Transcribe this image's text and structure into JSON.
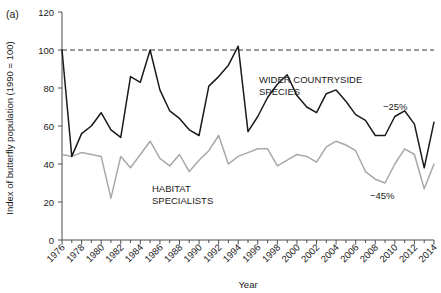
{
  "figure": {
    "panel_label": "(a)"
  },
  "chart_data": {
    "type": "line",
    "title": "",
    "xlabel": "Year",
    "ylabel": "Index of butterfly population (1990 = 100)",
    "xlim": [
      1976,
      2014
    ],
    "ylim": [
      0,
      120
    ],
    "yticks": [
      0,
      20,
      40,
      60,
      80,
      100,
      120
    ],
    "xticks": [
      1976,
      1978,
      1980,
      1982,
      1984,
      1986,
      1988,
      1990,
      1992,
      1994,
      1996,
      1998,
      2000,
      2002,
      2004,
      2006,
      2008,
      2010,
      2012,
      2014
    ],
    "xtick_minor_step": 1,
    "grid": false,
    "legend_position": "inline-annotation",
    "reference_line": {
      "y": 100,
      "style": "dashed",
      "color": "#333333"
    },
    "x": [
      1976,
      1977,
      1978,
      1979,
      1980,
      1981,
      1982,
      1983,
      1984,
      1985,
      1986,
      1987,
      1988,
      1989,
      1990,
      1991,
      1992,
      1993,
      1994,
      1995,
      1996,
      1997,
      1998,
      1999,
      2000,
      2001,
      2002,
      2003,
      2004,
      2005,
      2006,
      2007,
      2008,
      2009,
      2010,
      2011,
      2012,
      2013,
      2014
    ],
    "series": [
      {
        "name": "WIDER COUNTRYSIDE SPECIES",
        "color": "#1a1a1a",
        "values": [
          100,
          44,
          56,
          60,
          67,
          58,
          54,
          86,
          83,
          100,
          79,
          68,
          64,
          58,
          55,
          81,
          86,
          92,
          102,
          57,
          65,
          75,
          82,
          87,
          76,
          70,
          67,
          77,
          79,
          73,
          66,
          63,
          55,
          55,
          65,
          68,
          61,
          38,
          62
        ]
      },
      {
        "name": "HABITAT SPECIALISTS",
        "color": "#a8a8a8",
        "values": [
          45,
          44,
          46,
          45,
          44,
          22,
          44,
          38,
          45,
          52,
          43,
          39,
          45,
          36,
          42,
          47,
          55,
          40,
          44,
          46,
          48,
          48,
          39,
          42,
          45,
          44,
          41,
          49,
          52,
          50,
          47,
          36,
          32,
          30,
          40,
          48,
          45,
          27,
          40
        ]
      }
    ],
    "annotations": [
      {
        "text": "WIDER COUNTRYSIDE",
        "x_px": 259,
        "y_px": 83
      },
      {
        "text": "SPECIES",
        "x_px": 259,
        "y_px": 95
      },
      {
        "text": "HABITAT",
        "x_px": 152,
        "y_px": 192
      },
      {
        "text": "SPECIALISTS",
        "x_px": 152,
        "y_px": 204
      },
      {
        "text": "−25%",
        "x_px": 383,
        "y_px": 110
      },
      {
        "text": "−45%",
        "x_px": 370,
        "y_px": 199
      }
    ]
  }
}
